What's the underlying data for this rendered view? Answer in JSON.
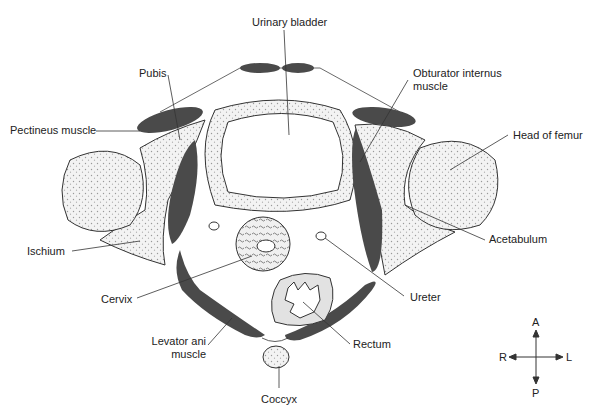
{
  "diagram": {
    "type": "anatomical cross-section",
    "labels": {
      "urinary_bladder": "Urinary bladder",
      "pubis": "Pubis",
      "pectineus": "Pectineus muscle",
      "obturator_line1": "Obturator internus",
      "obturator_line2": "muscle",
      "head_of_femur": "Head of femur",
      "ischium": "Ischium",
      "acetabulum": "Acetabulum",
      "cervix": "Cervix",
      "ureter": "Ureter",
      "levator_line1": "Levator ani",
      "levator_line2": "muscle",
      "rectum": "Rectum",
      "coccyx": "Coccyx"
    },
    "compass": {
      "anterior": "A",
      "posterior": "P",
      "right": "R",
      "left": "L"
    },
    "colors": {
      "muscle": "#4a4a4a",
      "bone_fill": "#ececec",
      "outline": "#333333",
      "line": "#333333"
    }
  }
}
